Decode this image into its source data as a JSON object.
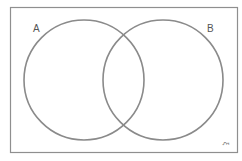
{
  "diagram": {
    "type": "venn",
    "sets": [
      {
        "label": "A"
      },
      {
        "label": "B"
      }
    ],
    "universal_symbol": "ξ",
    "colors": {
      "outline": "#8a8a8a",
      "circle": "#8a8a8a"
    }
  }
}
